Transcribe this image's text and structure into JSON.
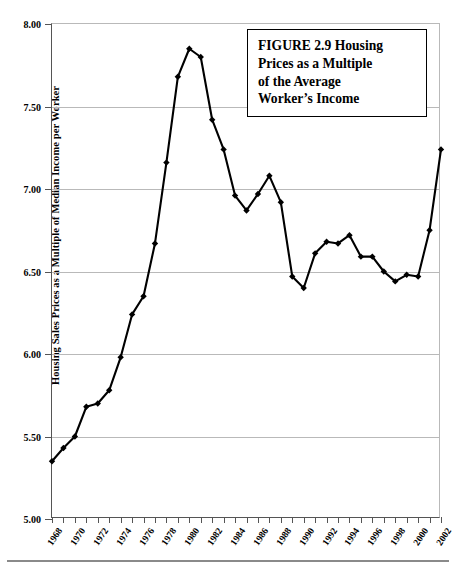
{
  "figure": {
    "caption": "FIGURE 2.9  Housing Prices as a Multiple of the Average Worker’s Income",
    "caption_lines": [
      "FIGURE 2.9  Housing",
      "Prices as a Multiple",
      "of the Average",
      "Worker’s Income"
    ]
  },
  "chart_data": {
    "type": "line",
    "xlabel": "",
    "ylabel": "Housing Sales Prices as a Multiple of Median Income per Worker",
    "ylim": [
      5.0,
      8.0
    ],
    "xlim": [
      1968,
      2002
    ],
    "ytick_labels": [
      "8.00",
      "7.50",
      "7.00",
      "6.50",
      "6.00",
      "5.50",
      "5.00"
    ],
    "ytick_values": [
      8.0,
      7.5,
      7.0,
      6.5,
      6.0,
      5.5,
      5.0
    ],
    "xtick_labels": [
      "1968",
      "1970",
      "1972",
      "1974",
      "1976",
      "1978",
      "1980",
      "1982",
      "1984",
      "1986",
      "1988",
      "1990",
      "1992",
      "1994",
      "1996",
      "1998",
      "2000",
      "2002"
    ],
    "xtick_values": [
      1968,
      1970,
      1972,
      1974,
      1976,
      1978,
      1980,
      1982,
      1984,
      1986,
      1988,
      1990,
      1992,
      1994,
      1996,
      1998,
      2000,
      2002
    ],
    "minor_xticks": [
      1969,
      1971,
      1973,
      1975,
      1977,
      1979,
      1981,
      1983,
      1985,
      1987,
      1989,
      1991,
      1993,
      1995,
      1997,
      1999,
      2001
    ],
    "grid": "horizontal",
    "legend": "none",
    "marker": "diamond",
    "line_color": "#000000",
    "x": [
      1968,
      1969,
      1970,
      1971,
      1972,
      1973,
      1974,
      1975,
      1976,
      1977,
      1978,
      1979,
      1980,
      1981,
      1982,
      1983,
      1984,
      1985,
      1986,
      1987,
      1988,
      1989,
      1990,
      1991,
      1992,
      1993,
      1994,
      1995,
      1996,
      1997,
      1998,
      1999,
      2000,
      2001,
      2002
    ],
    "values": [
      5.35,
      5.43,
      5.5,
      5.68,
      5.7,
      5.78,
      5.98,
      6.24,
      6.35,
      6.67,
      7.16,
      7.68,
      7.85,
      7.8,
      7.42,
      7.24,
      6.96,
      6.87,
      6.97,
      7.08,
      6.92,
      6.47,
      6.4,
      6.61,
      6.68,
      6.67,
      6.72,
      6.59,
      6.59,
      6.5,
      6.44,
      6.48,
      6.47,
      6.75,
      7.24
    ],
    "series": [
      {
        "name": "Housing sales price / median income per worker",
        "values": [
          5.35,
          5.43,
          5.5,
          5.68,
          5.7,
          5.78,
          5.98,
          6.24,
          6.35,
          6.67,
          7.16,
          7.68,
          7.85,
          7.8,
          7.42,
          7.24,
          6.96,
          6.87,
          6.97,
          7.08,
          6.92,
          6.47,
          6.4,
          6.61,
          6.68,
          6.67,
          6.72,
          6.59,
          6.59,
          6.5,
          6.44,
          6.48,
          6.47,
          6.75,
          7.24
        ]
      }
    ]
  }
}
